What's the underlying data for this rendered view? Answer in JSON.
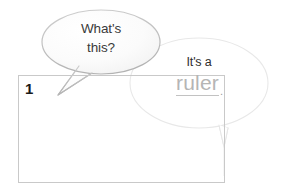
{
  "canvas": {
    "width": 283,
    "height": 194,
    "background": "#ffffff"
  },
  "diagram": {
    "label_number": "1",
    "rect_border_color": "#c9c9c9"
  },
  "callouts": [
    {
      "id": "question-bubble",
      "line1": "What's",
      "line2": "this?",
      "text_color": "#3a3a3a",
      "outline_color": "#bdbdbd",
      "fill_color": "#fbfbfb"
    },
    {
      "id": "answer-bubble",
      "lead": "It's a",
      "term": "ruler",
      "period": ".",
      "lead_color": "#2d2d2d",
      "term_color": "#b5b5b5",
      "outline_color": "#ebebeb",
      "fill_color": "#ffffff"
    }
  ]
}
